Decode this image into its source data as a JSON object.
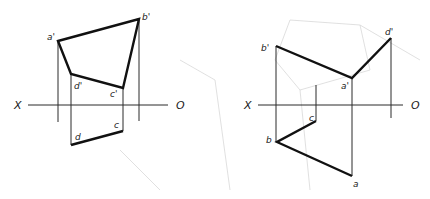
{
  "figure": {
    "left": {
      "axis": {
        "left_label": "X",
        "right_label": "O"
      },
      "front_view": {
        "labels": {
          "a": "a'",
          "b": "b'",
          "c": "c'",
          "d": "d'"
        }
      },
      "top_view": {
        "labels": {
          "c": "c",
          "d": "d"
        }
      }
    },
    "right": {
      "axis": {
        "left_label": "X",
        "right_label": "O"
      },
      "front_view": {
        "labels": {
          "a": "a'",
          "b": "b'",
          "d": "d'"
        }
      },
      "top_view": {
        "labels": {
          "a": "a",
          "b": "b",
          "c": "c"
        }
      }
    }
  },
  "colors": {
    "line": "#111111",
    "projector": "#2a2a2a",
    "background_sketch": "#d8d8d8"
  }
}
